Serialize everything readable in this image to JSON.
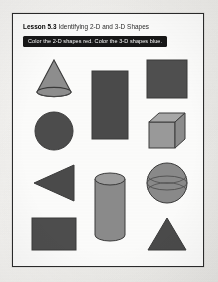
{
  "worksheet": {
    "lesson_number": "Lesson 5.3",
    "lesson_title": "Identifying 2-D and 3-D Shapes",
    "instruction": "Color the 2-D shapes red. Color the 3-D shapes blue.",
    "frame_color": "#2b2b2b",
    "paper_color": "#f4f3f0",
    "instruction_bar_color": "#171717",
    "instruction_text_color": "#ffffff"
  },
  "shapes": [
    {
      "id": "shape-cone",
      "name": "cone",
      "dimension": "3-D",
      "row": 1,
      "column": 1,
      "fill": "#8e8e8e",
      "stroke": "#3a3a3a"
    },
    {
      "id": "shape-rectangle-tall",
      "name": "rectangle",
      "dimension": "2-D",
      "row": 1,
      "column": 2,
      "fill": "#4a4a4a",
      "stroke": "#3a3a3a"
    },
    {
      "id": "shape-square",
      "name": "square",
      "dimension": "2-D",
      "row": 1,
      "column": 3,
      "fill": "#4f4f4f",
      "stroke": "#3a3a3a"
    },
    {
      "id": "shape-circle",
      "name": "circle",
      "dimension": "2-D",
      "row": 2,
      "column": 1,
      "fill": "#4c4c4c",
      "stroke": "#3a3a3a"
    },
    {
      "id": "shape-cube",
      "name": "cube",
      "dimension": "3-D",
      "row": 2,
      "column": 3,
      "fill": "#9a9a9a",
      "stroke": "#3c3c3c"
    },
    {
      "id": "shape-triangle-left",
      "name": "triangle",
      "dimension": "2-D",
      "row": 3,
      "column": 1,
      "fill": "#4a4a4a",
      "stroke": "#3a3a3a"
    },
    {
      "id": "shape-cylinder",
      "name": "cylinder",
      "dimension": "3-D",
      "row": 3,
      "column": 2,
      "fill": "#8b8b8b",
      "stroke": "#3a3a3a"
    },
    {
      "id": "shape-sphere",
      "name": "sphere",
      "dimension": "3-D",
      "row": 3,
      "column": 3,
      "fill": "#8a8a8a",
      "stroke": "#3a3a3a"
    },
    {
      "id": "shape-rectangle-wide",
      "name": "rectangle",
      "dimension": "2-D",
      "row": 4,
      "column": 1,
      "fill": "#4d4d4d",
      "stroke": "#3a3a3a"
    },
    {
      "id": "shape-triangle-up",
      "name": "triangle",
      "dimension": "2-D",
      "row": 4,
      "column": 3,
      "fill": "#4a4a4a",
      "stroke": "#3a3a3a"
    }
  ]
}
